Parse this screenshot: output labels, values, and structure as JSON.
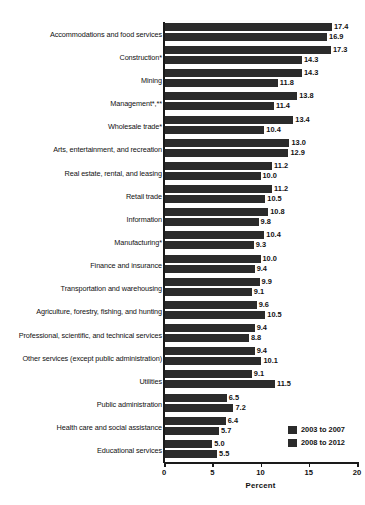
{
  "chart_data": {
    "type": "bar",
    "title": "",
    "xlabel": "Percent",
    "ylabel": "",
    "orientation": "horizontal",
    "xlim": [
      0,
      20
    ],
    "xticks": [
      0,
      5,
      10,
      15,
      20
    ],
    "xtick_labels": [
      "0",
      "5",
      "10",
      "15",
      "20"
    ],
    "grid": false,
    "legend_position": "bottom-right",
    "categories": [
      "Accommodations and food services",
      "Construction*",
      "Mining",
      "Management*,**",
      "Wholesale trade*",
      "Arts, entertainment, and recreation",
      "Real estate, rental, and leasing",
      "Retail trade",
      "Information",
      "Manufacturing*",
      "Finance and insurance",
      "Transportation and warehousing",
      "Agriculture, forestry, fishing, and hunting",
      "Professional, scientific, and technical services",
      "Other services (except public administration)",
      "Utilities",
      "Public administration",
      "Health care and social assistance",
      "Educational services"
    ],
    "series": [
      {
        "name": "2003 to 2007",
        "values": [
          17.4,
          17.3,
          14.3,
          13.8,
          13.4,
          13.0,
          11.2,
          11.2,
          10.8,
          10.4,
          10.0,
          9.9,
          9.6,
          9.4,
          9.4,
          9.1,
          6.5,
          6.4,
          5.0
        ]
      },
      {
        "name": "2008 to 2012",
        "values": [
          16.9,
          14.3,
          11.8,
          11.4,
          10.4,
          12.9,
          10.0,
          10.5,
          9.8,
          9.3,
          9.4,
          9.1,
          10.5,
          8.8,
          10.1,
          11.5,
          7.2,
          5.7,
          5.5
        ]
      }
    ],
    "value_label_format": "one-decimal",
    "colors": {
      "bar": "#2b2b2b",
      "text": "#111111",
      "axis": "#1a1a1a",
      "background": "#ffffff"
    }
  }
}
